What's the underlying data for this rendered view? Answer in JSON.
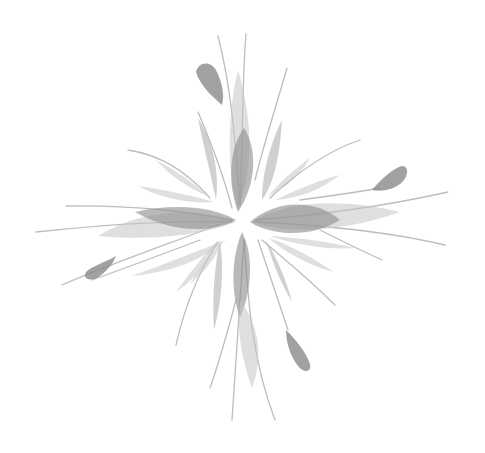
{
  "image": {
    "description": "Grayscale watercolor-style floral starburst illustration on white background",
    "background_color": "#ffffff",
    "palette": {
      "dark_leaf": "#8e8e8e",
      "mid_leaf": "#a9a9a9",
      "light_leaf": "#c4c4c4",
      "stem": "#bdbdbd"
    },
    "center": {
      "x": 243,
      "y": 222
    },
    "arms": [
      "top",
      "right",
      "bottom",
      "left"
    ]
  }
}
